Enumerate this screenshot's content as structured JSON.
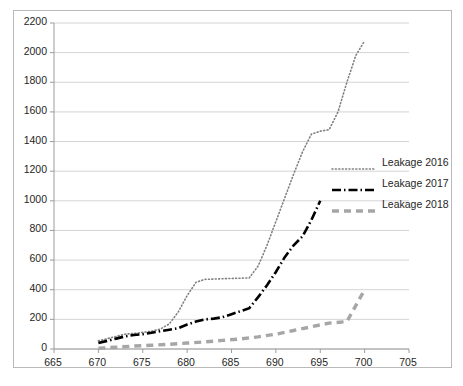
{
  "chart_data": {
    "type": "line",
    "title": "",
    "xlabel": "",
    "ylabel": "",
    "xlim": [
      665,
      705
    ],
    "ylim": [
      0,
      2200
    ],
    "xticks": [
      665,
      670,
      675,
      680,
      685,
      690,
      695,
      700,
      705
    ],
    "yticks": [
      0,
      200,
      400,
      600,
      800,
      1000,
      1200,
      1400,
      1600,
      1800,
      2000,
      2200
    ],
    "grid": "horizontal",
    "legend_position": "right-middle",
    "series": [
      {
        "name": "Leakage 2016",
        "style": "dotted",
        "color": "#808080",
        "x": [
          670,
          671,
          672,
          673,
          674,
          675,
          676,
          677,
          678,
          679,
          680,
          681,
          682,
          683,
          684,
          685,
          686,
          687,
          688,
          689,
          690,
          691,
          692,
          693,
          694,
          695,
          696,
          697,
          698,
          699,
          700
        ],
        "y": [
          55,
          70,
          85,
          100,
          105,
          112,
          120,
          135,
          170,
          250,
          360,
          450,
          470,
          472,
          474,
          476,
          478,
          480,
          560,
          700,
          860,
          1020,
          1180,
          1330,
          1450,
          1470,
          1480,
          1600,
          1800,
          1980,
          2080
        ]
      },
      {
        "name": "Leakage 2017",
        "style": "dash-dot",
        "color": "#000000",
        "x": [
          670,
          671,
          672,
          673,
          674,
          675,
          676,
          677,
          678,
          679,
          680,
          681,
          682,
          683,
          684,
          685,
          686,
          687,
          688,
          689,
          690,
          691,
          692,
          693,
          694,
          695
        ],
        "y": [
          40,
          55,
          70,
          85,
          95,
          100,
          110,
          120,
          130,
          140,
          165,
          185,
          200,
          205,
          215,
          235,
          255,
          275,
          350,
          430,
          520,
          620,
          700,
          760,
          870,
          1000
        ]
      },
      {
        "name": "Leakage 2018",
        "style": "dashed",
        "color": "#a6a6a6",
        "x": [
          670,
          672,
          674,
          676,
          678,
          680,
          682,
          684,
          686,
          688,
          690,
          692,
          694,
          696,
          698,
          700
        ],
        "y": [
          5,
          12,
          20,
          25,
          32,
          40,
          48,
          58,
          68,
          82,
          100,
          125,
          150,
          175,
          185,
          400
        ]
      }
    ]
  },
  "axes": {
    "y_tick_labels": [
      "2200",
      "2000",
      "1800",
      "1600",
      "1400",
      "1200",
      "1000",
      "800",
      "600",
      "400",
      "200",
      "0"
    ],
    "x_tick_labels": [
      "665",
      "670",
      "675",
      "680",
      "685",
      "690",
      "695",
      "700",
      "705"
    ]
  },
  "legend": {
    "items": [
      {
        "label": "Leakage 2016",
        "swatch": "dotted-line-swatch"
      },
      {
        "label": "Leakage 2017",
        "swatch": "dash-dot-line-swatch"
      },
      {
        "label": "Leakage 2018",
        "swatch": "dashed-line-swatch"
      }
    ]
  },
  "colors": {
    "series_2016": "#808080",
    "series_2017": "#000000",
    "series_2018": "#a6a6a6",
    "grid": "#d4d4d4",
    "axis": "#9c9c9c",
    "border": "#b9b9b9",
    "text": "#262626"
  }
}
